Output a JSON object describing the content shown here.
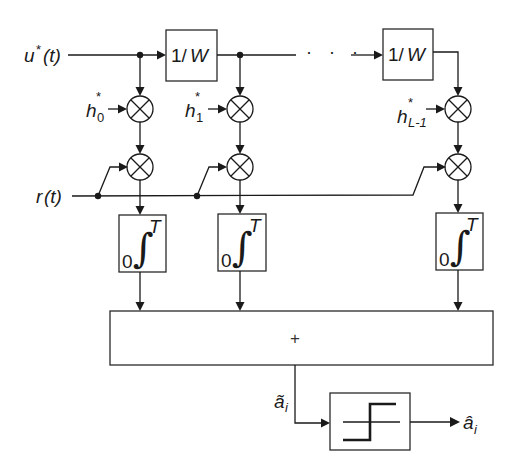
{
  "diagram": {
    "inputs": {
      "reference": "u*(t)",
      "reference_base": "u",
      "reference_sup": "*",
      "reference_arg": "(t)",
      "received": "r(t)",
      "received_base": "r",
      "received_arg": "(t)"
    },
    "delay_blocks": [
      {
        "label": "1/W",
        "label_num": "1/",
        "label_var": "W"
      },
      {
        "label": "1/W",
        "label_num": "1/",
        "label_var": "W"
      }
    ],
    "continuation": "· · ·",
    "taps": [
      {
        "coef": "h*0",
        "base": "h",
        "sup": "*",
        "sub": "0"
      },
      {
        "coef": "h*1",
        "base": "h",
        "sup": "*",
        "sub": "1"
      },
      {
        "coef": "h*L-1",
        "base": "h",
        "sup": "*",
        "sub": "L-1"
      }
    ],
    "multiplier_symbol": "×",
    "integrator": {
      "symbol": "∫",
      "lower": "0",
      "upper": "T"
    },
    "summer": {
      "symbol": "+"
    },
    "decision_input": {
      "label": "ã_i",
      "base": "ã",
      "sub": "i"
    },
    "decision_output": {
      "label": "â_i",
      "base": "â",
      "sub": "i"
    },
    "decision_block": "threshold (slicer)"
  }
}
